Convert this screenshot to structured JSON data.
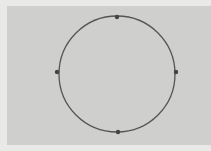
{
  "canvas": {
    "background": "#cfcfcd",
    "page_background": "#e9e9e7"
  },
  "shape": {
    "type": "circle",
    "cx": 117,
    "cy": 74,
    "r": 58,
    "stroke": "#555555",
    "stroke_width": 1.3,
    "fill": "none"
  },
  "handles": [
    {
      "name": "top",
      "x": 117,
      "y": 17
    },
    {
      "name": "right",
      "x": 176,
      "y": 72
    },
    {
      "name": "bottom",
      "x": 118,
      "y": 132
    },
    {
      "name": "left",
      "x": 57,
      "y": 72
    }
  ],
  "handle_color": "#444444"
}
